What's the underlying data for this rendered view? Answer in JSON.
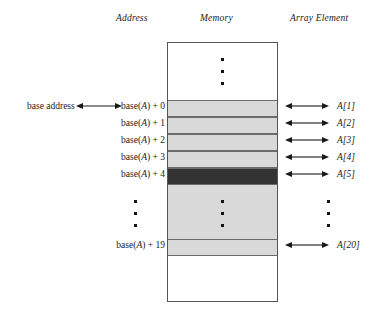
{
  "headers": {
    "address": "Address",
    "memory": "Memory",
    "array_element": "Array Element"
  },
  "base_address_caption": "base address",
  "address_labels": [
    "base(A) + 0",
    "base(A) + 1",
    "base(A) + 2",
    "base(A) + 3",
    "base(A) + 4",
    "base(A) + 19"
  ],
  "element_labels": [
    "A[1]",
    "A[2]",
    "A[3]",
    "A[4]",
    "A[5]",
    "A[20]"
  ],
  "colors": {
    "cell_light": "#d9d9d9",
    "cell_highlight": "#333333",
    "box_border": "#555555",
    "cell_border": "#6b6b6b",
    "text": "#1a1a1a"
  },
  "cells": [
    {
      "element": "A[1]",
      "address": "base(A) + 0",
      "highlighted": false
    },
    {
      "element": "A[2]",
      "address": "base(A) + 1",
      "highlighted": false
    },
    {
      "element": "A[3]",
      "address": "base(A) + 2",
      "highlighted": false
    },
    {
      "element": "A[4]",
      "address": "base(A) + 3",
      "highlighted": false
    },
    {
      "element": "A[5]",
      "address": "base(A) + 4",
      "highlighted": true
    },
    {
      "element": "A[20]",
      "address": "base(A) + 19",
      "highlighted": false
    }
  ],
  "ellipses": {
    "memory_top": "vertical-ellipsis",
    "address_middle": "vertical-ellipsis",
    "memory_middle": "vertical-ellipsis",
    "element_middle": "vertical-ellipsis"
  }
}
